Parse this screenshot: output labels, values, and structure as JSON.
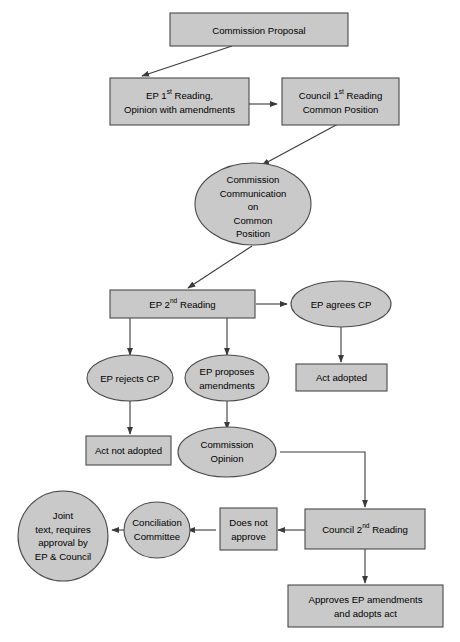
{
  "diagram": {
    "colors": {
      "node_fill": "#c9c9c9",
      "node_stroke": "#4a4a4a",
      "edge_stroke": "#3a3a3a",
      "background": "#ffffff",
      "text": "#000000"
    },
    "nodes": [
      {
        "id": "commission-proposal",
        "shape": "rect",
        "lines": [
          "Commission Proposal"
        ]
      },
      {
        "id": "ep-first-reading",
        "shape": "rect",
        "lines": [
          "EP 1st Reading,",
          "Opinion with amendments"
        ],
        "line1_pre": "EP 1",
        "line1_sup": "st",
        "line1_post": " Reading,"
      },
      {
        "id": "council-first-reading",
        "shape": "rect",
        "lines": [
          "Council 1st Reading",
          "Common Position"
        ],
        "line1_pre": "Council 1",
        "line1_sup": "st",
        "line1_post": " Reading"
      },
      {
        "id": "commission-communication",
        "shape": "ellipse",
        "lines": [
          "Commission",
          "Communication",
          "on",
          "Common",
          "Position"
        ]
      },
      {
        "id": "ep-second-reading",
        "shape": "rect",
        "lines": [
          "EP 2nd Reading"
        ],
        "line1_pre": "EP 2",
        "line1_sup": "nd",
        "line1_post": " Reading"
      },
      {
        "id": "ep-agrees-cp",
        "shape": "ellipse",
        "lines": [
          "EP agrees CP"
        ]
      },
      {
        "id": "act-adopted",
        "shape": "rect",
        "lines": [
          "Act adopted"
        ]
      },
      {
        "id": "ep-rejects-cp",
        "shape": "ellipse",
        "lines": [
          "EP rejects CP"
        ]
      },
      {
        "id": "ep-proposes-amendments",
        "shape": "ellipse",
        "lines": [
          "EP proposes",
          "amendments"
        ]
      },
      {
        "id": "act-not-adopted",
        "shape": "rect",
        "lines": [
          "Act not adopted"
        ]
      },
      {
        "id": "commission-opinion",
        "shape": "ellipse",
        "lines": [
          "Commission",
          "Opinion"
        ]
      },
      {
        "id": "council-second-reading",
        "shape": "rect",
        "lines": [
          "Council 2nd Reading"
        ],
        "line1_pre": "Council 2",
        "line1_sup": "nd",
        "line1_post": " Reading"
      },
      {
        "id": "does-not-approve",
        "shape": "rect",
        "lines": [
          "Does not",
          "approve"
        ]
      },
      {
        "id": "conciliation-committee",
        "shape": "ellipse",
        "lines": [
          "Conciliation",
          "Committee"
        ]
      },
      {
        "id": "joint-text",
        "shape": "circle",
        "lines": [
          "Joint",
          "text, requires",
          "approval by",
          "EP & Council"
        ]
      },
      {
        "id": "approves-ep-amendments",
        "shape": "rect",
        "lines": [
          "Approves EP amendments",
          "and adopts act"
        ]
      }
    ],
    "edges": [
      {
        "from": "commission-proposal",
        "to": "ep-first-reading"
      },
      {
        "from": "ep-first-reading",
        "to": "council-first-reading"
      },
      {
        "from": "council-first-reading",
        "to": "commission-communication"
      },
      {
        "from": "commission-communication",
        "to": "ep-second-reading"
      },
      {
        "from": "ep-second-reading",
        "to": "ep-agrees-cp"
      },
      {
        "from": "ep-agrees-cp",
        "to": "act-adopted"
      },
      {
        "from": "ep-second-reading",
        "to": "ep-rejects-cp"
      },
      {
        "from": "ep-second-reading",
        "to": "ep-proposes-amendments"
      },
      {
        "from": "ep-rejects-cp",
        "to": "act-not-adopted"
      },
      {
        "from": "ep-proposes-amendments",
        "to": "commission-opinion"
      },
      {
        "from": "commission-opinion",
        "to": "council-second-reading"
      },
      {
        "from": "council-second-reading",
        "to": "does-not-approve"
      },
      {
        "from": "does-not-approve",
        "to": "conciliation-committee"
      },
      {
        "from": "conciliation-committee",
        "to": "joint-text"
      },
      {
        "from": "council-second-reading",
        "to": "approves-ep-amendments"
      }
    ]
  },
  "labels": {
    "commission_proposal": "Commission Proposal",
    "ep_first_reading_l1_pre": "EP 1",
    "ep_first_reading_l1_sup": "st",
    "ep_first_reading_l1_post": " Reading,",
    "ep_first_reading_l2": "Opinion with amendments",
    "council_first_reading_l1_pre": "Council 1",
    "council_first_reading_l1_sup": "st",
    "council_first_reading_l1_post": " Reading",
    "council_first_reading_l2": "Common Position",
    "commission_communication_l1": "Commission",
    "commission_communication_l2": "Communication",
    "commission_communication_l3": "on",
    "commission_communication_l4": "Common",
    "commission_communication_l5": "Position",
    "ep_second_reading_pre": "EP 2",
    "ep_second_reading_sup": "nd",
    "ep_second_reading_post": " Reading",
    "ep_agrees_cp": "EP agrees CP",
    "act_adopted": "Act adopted",
    "ep_rejects_cp": "EP rejects CP",
    "ep_proposes_l1": "EP proposes",
    "ep_proposes_l2": "amendments",
    "act_not_adopted": "Act not adopted",
    "commission_opinion_l1": "Commission",
    "commission_opinion_l2": "Opinion",
    "council_second_reading_pre": "Council 2",
    "council_second_reading_sup": "nd",
    "council_second_reading_post": " Reading",
    "does_not_approve_l1": "Does not",
    "does_not_approve_l2": "approve",
    "conciliation_l1": "Conciliation",
    "conciliation_l2": "Committee",
    "joint_text_l1": "Joint",
    "joint_text_l2": "text, requires",
    "joint_text_l3": "approval by",
    "joint_text_l4": "EP & Council",
    "approves_l1": "Approves EP amendments",
    "approves_l2": "and adopts act"
  }
}
